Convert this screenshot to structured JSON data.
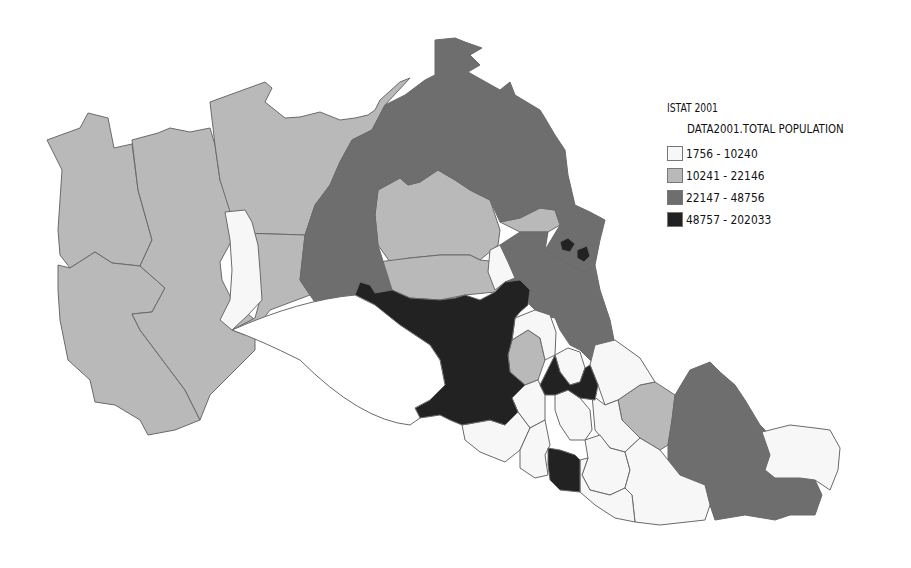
{
  "legend": {
    "title": "ISTAT 2001",
    "field": "DATA2001.TOTAL POPULATION",
    "classes": [
      {
        "label": "1756 - 10240",
        "color": "#f7f7f7"
      },
      {
        "label": "10241 - 22146",
        "color": "#b9b9b9"
      },
      {
        "label": "22147 - 48756",
        "color": "#6e6e6e"
      },
      {
        "label": "48757 - 202033",
        "color": "#222222"
      }
    ]
  },
  "map": {
    "description": "Choropleth map of municipalities, total population ISTAT 2001"
  }
}
